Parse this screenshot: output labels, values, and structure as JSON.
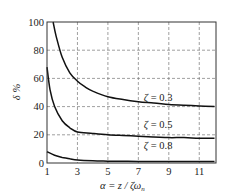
{
  "chart_data": {
    "type": "line",
    "title": "",
    "xlabel": "α = z / ζω_n",
    "ylabel": "δ %",
    "xlim": [
      1,
      12.1
    ],
    "ylim": [
      0,
      100
    ],
    "xticks": [
      1,
      3,
      5,
      7,
      9,
      11
    ],
    "yticks": [
      0,
      20,
      40,
      60,
      80,
      100
    ],
    "grid": true,
    "grid_style": "dashed",
    "legend": "inline labels",
    "series": [
      {
        "name": "ζ = 0.3",
        "label": "ζ = 0.3",
        "x": [
          1.4,
          1.6,
          2,
          2.5,
          3,
          3.5,
          4,
          5,
          6,
          7,
          8,
          9,
          10,
          11,
          12
        ],
        "y": [
          100,
          90,
          75,
          64,
          58,
          54,
          51,
          47,
          45,
          43.5,
          42.5,
          41.5,
          41,
          40.5,
          40
        ]
      },
      {
        "name": "ζ = 0.5",
        "label": "ζ = 0.5",
        "x": [
          1,
          1.2,
          1.5,
          2,
          2.5,
          3,
          4,
          5,
          6,
          7,
          8,
          9,
          10,
          11,
          12
        ],
        "y": [
          68,
          52,
          40,
          30,
          25,
          22,
          21,
          20,
          19.5,
          19,
          18.5,
          18,
          18,
          17.5,
          17.5
        ]
      },
      {
        "name": "ζ = 0.8",
        "label": "ζ = 0.8",
        "x": [
          1,
          1.5,
          2,
          2.5,
          3,
          4,
          5,
          7,
          9,
          11,
          12
        ],
        "y": [
          8,
          5.5,
          4,
          3,
          2.2,
          1.6,
          1.3,
          1.1,
          1,
          1,
          1
        ]
      }
    ],
    "annotations": [
      {
        "text": "ζ = 0.3",
        "x": 8.3,
        "y": 44
      },
      {
        "text": "ζ = 0.5",
        "x": 8.3,
        "y": 25
      },
      {
        "text": "ζ = 0.8",
        "x": 8.3,
        "y": 10
      }
    ]
  },
  "labels": {
    "ylabel": "δ %",
    "xlabel_alpha": "α",
    "xlabel_rest": " = z / ζω",
    "xlabel_sub": "n",
    "zeta03": "ζ = 0.3",
    "zeta05": "ζ = 0.5",
    "zeta08": "ζ = 0.8"
  }
}
